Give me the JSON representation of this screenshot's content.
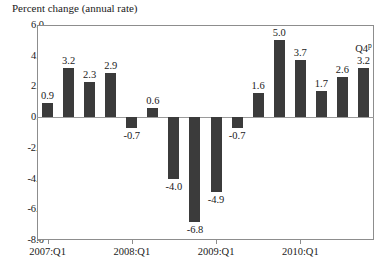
{
  "chart_data": {
    "type": "bar",
    "title": "Percent change (annual rate)",
    "xlabel": "",
    "ylabel": "",
    "ylim": [
      -8.0,
      6.0
    ],
    "grid": false,
    "legend": "none",
    "bar_color": "#3b3b3b",
    "axis_color": "#8d8d8d",
    "categories": [
      "2007:Q1",
      "2007:Q2",
      "2007:Q3",
      "2007:Q4",
      "2008:Q1",
      "2008:Q2",
      "2008:Q3",
      "2008:Q4",
      "2009:Q1",
      "2009:Q2",
      "2009:Q3",
      "2009:Q4",
      "2010:Q1",
      "2010:Q2",
      "2010:Q3",
      "2010:Q4"
    ],
    "values": [
      0.9,
      3.2,
      2.3,
      2.9,
      -0.7,
      0.6,
      -4.0,
      -6.8,
      -4.9,
      -0.7,
      1.6,
      5.0,
      3.7,
      1.7,
      2.6,
      3.2
    ],
    "data_labels": [
      "0.9",
      "3.2",
      "2.3",
      "2.9",
      "-0.7",
      "0.6",
      "-4.0",
      "-6.8",
      "-4.9",
      "-0.7",
      "1.6",
      "5.0",
      "3.7",
      "1.7",
      "2.6",
      "3.2"
    ],
    "ytick_labels": [
      "6.0",
      "4.0",
      "2.0",
      "0.0",
      "-2.0",
      "-4.0",
      "-6.0",
      "-8.0"
    ],
    "ytick_values": [
      6.0,
      4.0,
      2.0,
      0.0,
      -2.0,
      -4.0,
      -6.0,
      -8.0
    ],
    "xtick_labels": [
      "2007:Q1",
      "2008:Q1",
      "2009:Q1",
      "2010:Q1"
    ],
    "xtick_indices": [
      0,
      4,
      8,
      12
    ],
    "annotations": [
      {
        "text": "Q4",
        "superscript": "p",
        "series_index": 15
      }
    ]
  }
}
